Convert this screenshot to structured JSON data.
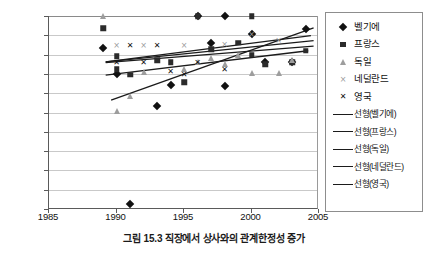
{
  "caption": "그림 15.3 직장에서 상사와의 관계한정성 증가",
  "chart_data": {
    "type": "scatter",
    "title": "",
    "xlabel": "",
    "ylabel": "",
    "xlim": [
      1985,
      2005
    ],
    "ylim": [
      50,
      100
    ],
    "xticks": [
      1985,
      1990,
      1995,
      2000,
      2005
    ],
    "yticks": [
      50,
      55,
      60,
      65,
      70,
      75,
      80,
      85,
      90,
      95,
      100
    ],
    "grid": true,
    "legend_position": "right",
    "series": [
      {
        "name": "벨기에",
        "marker": "diamond",
        "color": "#111111",
        "points": [
          {
            "x": 1989,
            "y": 91.6
          },
          {
            "x": 1990,
            "y": 85.0
          },
          {
            "x": 1991,
            "y": 51.2
          },
          {
            "x": 1993,
            "y": 76.8
          },
          {
            "x": 1994,
            "y": 82.2
          },
          {
            "x": 1996,
            "y": 100.0
          },
          {
            "x": 1997,
            "y": 93.0
          },
          {
            "x": 1998,
            "y": 100.0
          },
          {
            "x": 1998,
            "y": 81.8
          },
          {
            "x": 2000,
            "y": 95.4
          },
          {
            "x": 2001,
            "y": 88.0
          },
          {
            "x": 2003,
            "y": 88.0
          },
          {
            "x": 2004,
            "y": 96.6
          }
        ]
      },
      {
        "name": "프랑스",
        "marker": "square",
        "color": "#2b2b2b",
        "points": [
          {
            "x": 1989,
            "y": 96.8
          },
          {
            "x": 1990,
            "y": 89.6
          },
          {
            "x": 1990,
            "y": 86.2
          },
          {
            "x": 1991,
            "y": 84.8
          },
          {
            "x": 1993,
            "y": 88.5
          },
          {
            "x": 1994,
            "y": 88.0
          },
          {
            "x": 1995,
            "y": 82.9
          },
          {
            "x": 1996,
            "y": 100.0
          },
          {
            "x": 1997,
            "y": 91.4
          },
          {
            "x": 1999,
            "y": 93.1
          },
          {
            "x": 2000,
            "y": 100.0
          },
          {
            "x": 2000,
            "y": 90.0
          },
          {
            "x": 2001,
            "y": 87.5
          },
          {
            "x": 2003,
            "y": 88.0
          },
          {
            "x": 2004,
            "y": 91.0
          }
        ]
      },
      {
        "name": "독일",
        "marker": "triangle",
        "color": "#9d9d9d",
        "points": [
          {
            "x": 1989,
            "y": 100.0
          },
          {
            "x": 1990,
            "y": 75.4
          },
          {
            "x": 1991,
            "y": 79.2
          },
          {
            "x": 1992,
            "y": 85.5
          },
          {
            "x": 1995,
            "y": 86.3
          },
          {
            "x": 1996,
            "y": 88.0
          },
          {
            "x": 1997,
            "y": 89.0
          },
          {
            "x": 1998,
            "y": 87.6
          },
          {
            "x": 1999,
            "y": 89.8
          },
          {
            "x": 2000,
            "y": 85.3
          },
          {
            "x": 2002,
            "y": 85.2
          },
          {
            "x": 2003,
            "y": 88.5
          }
        ]
      },
      {
        "name": "네덜란드",
        "marker": "cross",
        "color": "#9a9a9a",
        "points": [
          {
            "x": 1990,
            "y": 92.2
          },
          {
            "x": 1992,
            "y": 92.2
          },
          {
            "x": 1995,
            "y": 92.2
          },
          {
            "x": 1998,
            "y": 92.5
          },
          {
            "x": 2000,
            "y": 95.2
          },
          {
            "x": 2002,
            "y": 93.6
          }
        ]
      },
      {
        "name": "영국",
        "marker": "x-bold",
        "color": "#111111",
        "points": [
          {
            "x": 1991,
            "y": 92.2
          },
          {
            "x": 1993,
            "y": 92.2
          },
          {
            "x": 1990,
            "y": 87.8
          },
          {
            "x": 1992,
            "y": 87.9
          },
          {
            "x": 1994,
            "y": 85.4
          },
          {
            "x": 1996,
            "y": 87.9
          },
          {
            "x": 1998,
            "y": 86.0
          },
          {
            "x": 1995,
            "y": 84.6
          }
        ]
      }
    ],
    "trendlines": [
      {
        "name": "선형(벨기에)",
        "x0": 1989.6,
        "y0": 78.2,
        "x1": 2004.6,
        "y1": 96.9,
        "color": "#1b1b1b"
      },
      {
        "name": "선형(프랑스)",
        "x0": 1989.2,
        "y0": 87.9,
        "x1": 2004.6,
        "y1": 92.2,
        "color": "#1b1b1b"
      },
      {
        "name": "선형(독일)",
        "x0": 1989.2,
        "y0": 84.7,
        "x1": 2004.2,
        "y1": 91.0,
        "color": "#1b1b1b"
      },
      {
        "name": "선형(네덜란드)",
        "x0": 1989.2,
        "y0": 88.1,
        "x1": 2004.4,
        "y1": 94.9,
        "color": "#1b1b1b"
      },
      {
        "name": "선형(영국)",
        "x0": 1989.2,
        "y0": 88.1,
        "x1": 2004.6,
        "y1": 93.6,
        "color": "#1b1b1b"
      }
    ]
  },
  "legend": {
    "items": [
      {
        "label": "벨기에",
        "symbol": "diamond-marker"
      },
      {
        "label": "프랑스",
        "symbol": "square-marker"
      },
      {
        "label": "독일",
        "symbol": "triangle-marker"
      },
      {
        "label": "네덜란드",
        "symbol": "cross-marker"
      },
      {
        "label": "영국",
        "symbol": "x-marker"
      },
      {
        "label": "선형(벨기에)",
        "symbol": "line-marker"
      },
      {
        "label": "선형(프랑스)",
        "symbol": "line-marker"
      },
      {
        "label": "선형(독일)",
        "symbol": "line-marker"
      },
      {
        "label": "선형(네덜란드)",
        "symbol": "line-marker"
      },
      {
        "label": "선형(영국)",
        "symbol": "line-marker"
      }
    ]
  }
}
